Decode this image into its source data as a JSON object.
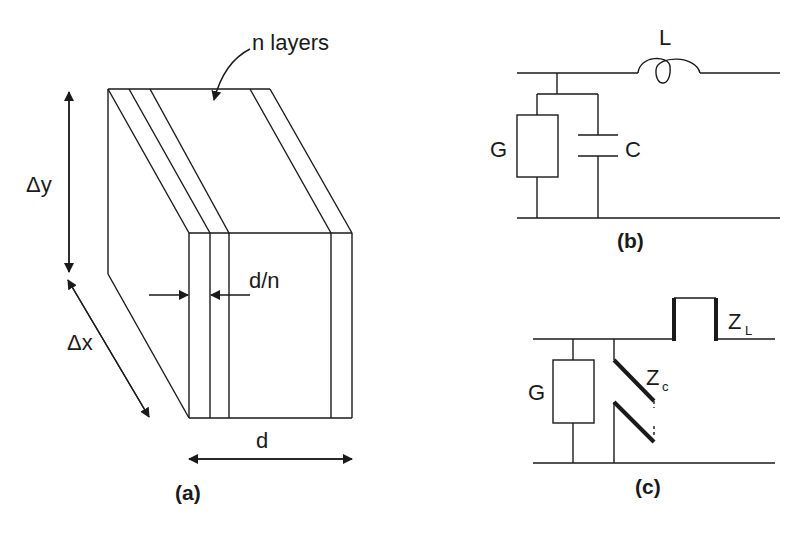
{
  "figure": {
    "panel_a": {
      "caption": "(a)",
      "labels": {
        "layers": "n layers",
        "delta_y": "Δy",
        "delta_x": "Δx",
        "layer_thickness": "d/n",
        "total_thickness": "d"
      }
    },
    "panel_b": {
      "caption": "(b)",
      "labels": {
        "inductor": "L",
        "conductance": "G",
        "capacitor": "C"
      }
    },
    "panel_c": {
      "caption": "(c)",
      "labels": {
        "conductance": "G",
        "zc_main": "Z",
        "zc_sub": "c",
        "zl_main": "Z",
        "zl_sub": "L"
      }
    },
    "colors": {
      "ink": "#1a1a1a",
      "background": "#ffffff"
    }
  }
}
